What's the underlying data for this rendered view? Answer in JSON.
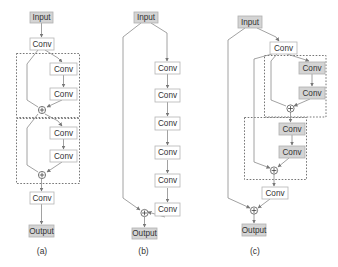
{
  "diagram": {
    "panels": [
      {
        "id": "a",
        "caption": "(a)",
        "nodes": {
          "input": "Input",
          "conv_head": "Conv",
          "block1_conv1": "Conv",
          "block1_conv2": "Conv",
          "block2_conv1": "Conv",
          "block2_conv2": "Conv",
          "conv_tail": "Conv",
          "output": "Output"
        },
        "description": "Two stacked residual blocks, each with two Conv layers and an identity skip connection summed at a plus node"
      },
      {
        "id": "b",
        "caption": "(b)",
        "nodes": {
          "input": "Input",
          "conv1": "Conv",
          "conv2": "Conv",
          "conv3": "Conv",
          "conv4": "Conv",
          "conv5": "Conv",
          "conv6": "Conv",
          "output": "Output"
        },
        "description": "Single global skip connection from Input around six Conv layers to a plus node before Output"
      },
      {
        "id": "c",
        "caption": "(c)",
        "nodes": {
          "input": "Input",
          "conv_head": "Conv",
          "block1_conv1": "Conv",
          "block1_conv2": "Conv",
          "block2_conv1": "Conv",
          "block2_conv2": "Conv",
          "conv_tail": "Conv",
          "output": "Output"
        },
        "description": "Global skip from Input to final plus node, plus local residual blocks with skips from the head Conv"
      }
    ],
    "operator_symbol": "+",
    "colors": {
      "io_box_fill": "#d4d4d4",
      "conv_box_fill": "#ffffff",
      "conv_box_filled": "#d4d4d4",
      "edge": "#8a8a8a",
      "dashed_border": "#666666"
    }
  }
}
